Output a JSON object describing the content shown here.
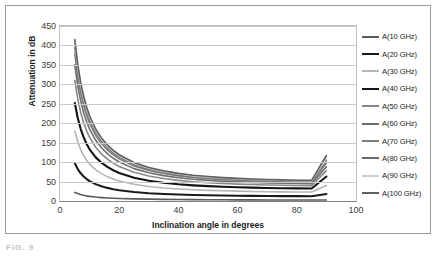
{
  "figure": {
    "caption": "FIG. 9"
  },
  "chart_data": {
    "type": "line",
    "title": "",
    "xlabel": "Inclination angle in degrees",
    "ylabel": "Attenuation in dB",
    "xlim": [
      0,
      100
    ],
    "ylim": [
      0,
      450
    ],
    "xticks": [
      0,
      20,
      40,
      60,
      80,
      100
    ],
    "yticks": [
      0,
      50,
      100,
      150,
      200,
      250,
      300,
      350,
      400,
      450
    ],
    "grid": "horizontal",
    "legend_position": "right",
    "x": [
      5,
      6,
      7,
      8,
      9,
      10,
      12,
      14,
      16,
      18,
      20,
      25,
      30,
      35,
      40,
      45,
      50,
      55,
      60,
      65,
      70,
      75,
      80,
      85,
      90
    ],
    "series": [
      {
        "name": "A(10 GHz)",
        "color": "#5a5a5a",
        "start_value": 22,
        "end_value": 2,
        "values": [
          22,
          19.0,
          16.5,
          14.6,
          13.1,
          11.9,
          10.1,
          8.8,
          7.8,
          7.1,
          6.5,
          5.4,
          4.7,
          4.2,
          3.8,
          3.5,
          3.3,
          3.1,
          3.0,
          2.8,
          2.7,
          2.6,
          2.5,
          2.4,
          2.4
        ]
      },
      {
        "name": "A(20 GHz)",
        "color": "#1a1a1a",
        "start_value": 97,
        "end_value": 18,
        "values": [
          97,
          82.1,
          71.2,
          62.9,
          56.4,
          51.2,
          43.4,
          37.9,
          33.7,
          30.4,
          27.8,
          23.1,
          20.1,
          18.1,
          16.6,
          15.5,
          14.7,
          14.1,
          13.6,
          13.2,
          12.9,
          12.6,
          12.5,
          12.4,
          18.0
        ]
      },
      {
        "name": "A(30 GHz)",
        "color": "#b4b4b4",
        "start_value": 180,
        "end_value": 40,
        "values": [
          180,
          152.4,
          132.1,
          116.8,
          104.7,
          95.0,
          80.6,
          70.4,
          62.6,
          56.5,
          51.6,
          42.9,
          37.3,
          33.6,
          30.9,
          28.8,
          27.3,
          26.2,
          25.3,
          24.6,
          23.9,
          23.5,
          23.2,
          23.0,
          40.0
        ]
      },
      {
        "name": "A(40 GHz)",
        "color": "#141414",
        "start_value": 252,
        "end_value": 63,
        "values": [
          252,
          213.3,
          184.9,
          163.5,
          146.6,
          133.0,
          112.8,
          98.5,
          87.6,
          79.1,
          72.2,
          60.0,
          52.2,
          47.0,
          43.2,
          40.3,
          38.2,
          36.6,
          35.4,
          34.4,
          33.5,
          32.9,
          32.5,
          32.2,
          63.0
        ]
      },
      {
        "name": "A(50 GHz)",
        "color": "#888888",
        "start_value": 310,
        "end_value": 78,
        "values": [
          310,
          262.4,
          227.4,
          201.1,
          180.4,
          163.6,
          138.8,
          121.2,
          107.8,
          97.3,
          88.8,
          73.8,
          64.2,
          57.8,
          53.1,
          49.6,
          47.0,
          45.0,
          43.5,
          42.3,
          41.3,
          40.5,
          40.0,
          39.6,
          78.0
        ]
      },
      {
        "name": "A(60 GHz)",
        "color": "#6e6e6e",
        "start_value": 350,
        "end_value": 88,
        "values": [
          350,
          296.3,
          256.7,
          227.0,
          203.7,
          184.7,
          156.7,
          136.8,
          121.7,
          109.8,
          100.3,
          83.3,
          72.5,
          65.3,
          59.9,
          56.0,
          53.1,
          50.8,
          49.1,
          47.8,
          46.6,
          45.8,
          45.1,
          44.7,
          88.0
        ]
      },
      {
        "name": "A(70 GHz)",
        "color": "#7d7d7d",
        "start_value": 378,
        "end_value": 98,
        "values": [
          378,
          320.0,
          277.2,
          245.2,
          220.0,
          199.5,
          169.2,
          147.7,
          131.4,
          118.6,
          108.3,
          90.0,
          78.3,
          70.5,
          64.7,
          60.4,
          57.3,
          54.9,
          53.0,
          51.6,
          50.4,
          49.4,
          48.7,
          48.3,
          98.0
        ]
      },
      {
        "name": "A(80 GHz)",
        "color": "#6a6a6a",
        "start_value": 395,
        "end_value": 105,
        "values": [
          395,
          334.4,
          289.7,
          256.3,
          229.9,
          208.5,
          176.8,
          154.4,
          137.4,
          123.9,
          113.2,
          94.1,
          81.9,
          73.7,
          67.6,
          63.1,
          59.9,
          57.4,
          55.4,
          53.9,
          52.6,
          51.7,
          51.0,
          50.5,
          105.0
        ]
      },
      {
        "name": "A(90 GHz)",
        "color": "#cfcfcf",
        "start_value": 405,
        "end_value": 110,
        "values": [
          405,
          342.9,
          297.0,
          262.8,
          235.7,
          213.8,
          181.3,
          158.3,
          140.9,
          127.0,
          116.1,
          96.5,
          84.0,
          75.6,
          69.3,
          64.7,
          61.4,
          58.8,
          56.8,
          55.2,
          53.9,
          53.0,
          52.3,
          51.8,
          110.0
        ]
      },
      {
        "name": "A(100 GHz)",
        "color": "#5f5f5f",
        "start_value": 415,
        "end_value": 117,
        "values": [
          415,
          351.4,
          304.3,
          269.3,
          241.5,
          219.0,
          185.7,
          162.2,
          144.4,
          130.1,
          118.9,
          98.9,
          86.0,
          77.4,
          71.0,
          66.3,
          62.9,
          60.2,
          58.2,
          56.5,
          55.2,
          54.3,
          53.5,
          53.1,
          117.0
        ]
      }
    ]
  }
}
